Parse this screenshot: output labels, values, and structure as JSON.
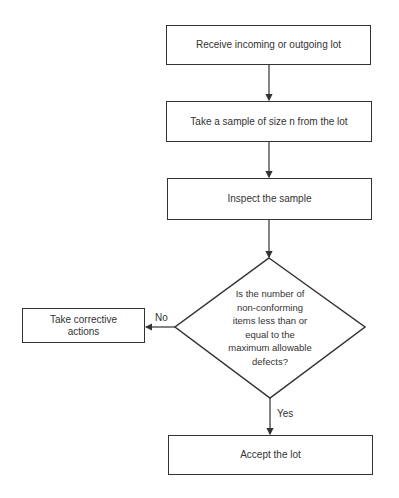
{
  "diagram": {
    "type": "flowchart",
    "nodes": [
      {
        "id": "receive",
        "shape": "process",
        "label": "Receive incoming or outgoing lot"
      },
      {
        "id": "sample",
        "shape": "process",
        "label": "Take a sample of size n from the lot"
      },
      {
        "id": "inspect",
        "shape": "process",
        "label": "Inspect the sample"
      },
      {
        "id": "decision",
        "shape": "decision",
        "label": "Is the number of non-conforming items less than or equal to the maximum allowable defects?",
        "lines": [
          "Is the number of",
          "non-conforming",
          "items less than or",
          "equal to the",
          "maximum allowable",
          "defects?"
        ]
      },
      {
        "id": "corrective",
        "shape": "process",
        "label": "Take corrective actions"
      },
      {
        "id": "accept",
        "shape": "process",
        "label": "Accept the lot"
      }
    ],
    "edges": [
      {
        "from": "receive",
        "to": "sample",
        "label": ""
      },
      {
        "from": "sample",
        "to": "inspect",
        "label": ""
      },
      {
        "from": "inspect",
        "to": "decision",
        "label": ""
      },
      {
        "from": "decision",
        "to": "corrective",
        "label": "No"
      },
      {
        "from": "decision",
        "to": "accept",
        "label": "Yes"
      }
    ],
    "colors": {
      "stroke": "#333333",
      "background": "#ffffff",
      "text": "#333333"
    }
  }
}
